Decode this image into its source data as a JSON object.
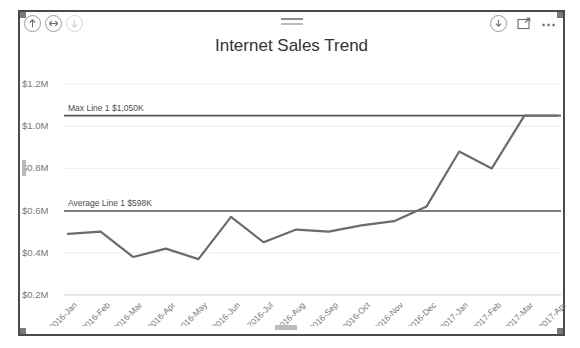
{
  "visual": {
    "title": "Internet Sales Trend",
    "header": {
      "icons_left": [
        {
          "name": "drill-up-icon",
          "glyph": "up-arrow"
        },
        {
          "name": "drill-down-expand-icon",
          "glyph": "double-arrow"
        },
        {
          "name": "drill-down-icon",
          "glyph": "down-arrow"
        }
      ],
      "icons_right": [
        {
          "name": "filter-icon",
          "glyph": "down-arrow-circle"
        },
        {
          "name": "focus-mode-icon",
          "glyph": "expand-square"
        },
        {
          "name": "more-options-icon",
          "glyph": "..."
        }
      ],
      "drag_handle": "drag-handle"
    }
  },
  "chart_data": {
    "type": "line",
    "title": "Internet Sales Trend",
    "xlabel": "",
    "ylabel": "",
    "grid": true,
    "legend": "none",
    "ylim": [
      0.2,
      1.2
    ],
    "ytick_labels": [
      "$1.2M",
      "$1.0M",
      "$0.8M",
      "$0.6M",
      "$0.4M",
      "$0.2M"
    ],
    "ytick_values": [
      1.2,
      1.0,
      0.8,
      0.6,
      0.4,
      0.2
    ],
    "categories": [
      "2016-Jan",
      "2016-Feb",
      "2016-Mar",
      "2016-Apr",
      "2016-May",
      "2016-Jun",
      "2016-Jul",
      "2016-Aug",
      "2016-Sep",
      "2016-Oct",
      "2016-Nov",
      "2016-Dec",
      "2017-Jan",
      "2017-Feb",
      "2017-Mar",
      "2017-Apr"
    ],
    "series": [
      {
        "name": "Internet Sales",
        "color": "#6b6b6b",
        "values": [
          0.49,
          0.5,
          0.38,
          0.42,
          0.37,
          0.57,
          0.45,
          0.51,
          0.5,
          0.53,
          0.55,
          0.62,
          0.88,
          0.8,
          1.05,
          1.05
        ]
      }
    ],
    "reference_lines": [
      {
        "name": "max-line",
        "label": "Max Line 1 $1,050K",
        "value": 1.05,
        "color": "#555555"
      },
      {
        "name": "average-line",
        "label": "Average Line 1 $598K",
        "value": 0.598,
        "color": "#555555"
      }
    ]
  }
}
